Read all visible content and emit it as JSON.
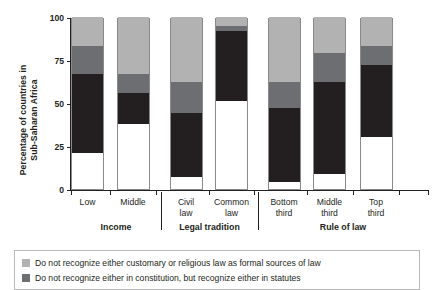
{
  "chart_data": {
    "type": "bar",
    "subtype": "stacked-percentage",
    "title": "",
    "xlabel": "",
    "ylabel": "Percentage of countries in Sub-Saharan Africa",
    "ylabel_lines": [
      "Percentage of countries in",
      "Sub-Saharan Africa"
    ],
    "ylim": [
      0,
      100
    ],
    "yticks": [
      0,
      25,
      50,
      75,
      100
    ],
    "ytick_labels": [
      "0",
      "25",
      "50",
      "75",
      "100"
    ],
    "grid": false,
    "legend_position": "bottom",
    "categories": [
      "Low",
      "Middle",
      "Civil law",
      "Common law",
      "Bottom third",
      "Middle third",
      "Top third"
    ],
    "category_lines": [
      [
        "Low"
      ],
      [
        "Middle"
      ],
      [
        "Civil",
        "law"
      ],
      [
        "Common",
        "law"
      ],
      [
        "Bottom",
        "third"
      ],
      [
        "Middle",
        "third"
      ],
      [
        "Top",
        "third"
      ]
    ],
    "groups": [
      {
        "label": "Income",
        "categories": [
          "Low",
          "Middle"
        ]
      },
      {
        "label": "Legal tradition",
        "categories": [
          "Civil law",
          "Common law"
        ]
      },
      {
        "label": "Rule of law",
        "categories": [
          "Bottom third",
          "Middle third",
          "Top third"
        ]
      }
    ],
    "series": [
      {
        "name": "Recognize in constitution",
        "color": "#ffffff",
        "in_legend": false,
        "values": [
          21,
          38,
          7,
          51,
          4,
          9,
          30
        ]
      },
      {
        "name": "Do not recognize either in constitution, but recognize either in statutes",
        "color": "#231f20",
        "in_legend": false,
        "values": [
          46,
          18,
          37,
          41,
          43,
          53,
          42
        ]
      },
      {
        "name": "Do not recognize either in constitution, but recognize either in statutes",
        "color": "#6d6e71",
        "in_legend": true,
        "legend_index": 1,
        "values": [
          16,
          11,
          18,
          3,
          15,
          17,
          11
        ]
      },
      {
        "name": "Do not recognize either customary or religious law as formal sources of law",
        "color": "#b2b2b2",
        "in_legend": true,
        "legend_index": 0,
        "values": [
          17,
          33,
          38,
          5,
          38,
          21,
          17
        ]
      }
    ],
    "legend_entries": [
      {
        "swatch": "#b2b2b2",
        "label": "Do not recognize either customary or religious law as formal sources of law"
      },
      {
        "swatch": "#6d6e71",
        "label": "Do not recognize either in constitution, but recognize either in statutes"
      }
    ]
  },
  "colors": {
    "axis": "#231f20",
    "bar_outline": "#8a8a8a",
    "legend_border": "#b9b9b9",
    "light_gray": "#b2b2b2",
    "dark_gray": "#6d6e71",
    "black": "#231f20",
    "white": "#ffffff"
  }
}
